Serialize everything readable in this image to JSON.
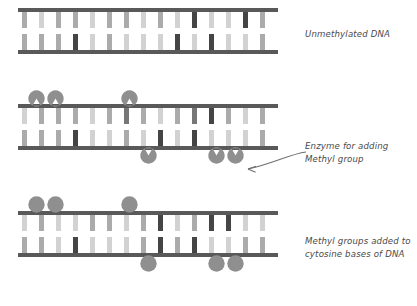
{
  "diagram": {
    "colors": {
      "backbone": "#595959",
      "base_light": "#d2d2d2",
      "base_mid": "#ababab",
      "base_dark": "#454545",
      "base_medium_dark": "#777777",
      "blob_fill": "#8f8f8f",
      "text": "#4a4a4a",
      "background": "#ffffff"
    },
    "labels": {
      "unmethylated": "Unmethylated DNA",
      "enzyme": "Enzyme for adding\nMethyl group",
      "methylated": "Methyl groups added to\ncytosine bases of DNA"
    },
    "panels": [
      {
        "id": "panel-unmethylated",
        "name": "Unmethylated DNA strand",
        "blob_shape": "none",
        "top_rungs": [
          {
            "x": 4,
            "shade": "base_mid"
          },
          {
            "x": 21,
            "shade": "base_light"
          },
          {
            "x": 38,
            "shade": "base_mid"
          },
          {
            "x": 55,
            "shade": "base_mid"
          },
          {
            "x": 72,
            "shade": "base_light"
          },
          {
            "x": 89,
            "shade": "base_mid"
          },
          {
            "x": 106,
            "shade": "base_mid"
          },
          {
            "x": 123,
            "shade": "base_light"
          },
          {
            "x": 140,
            "shade": "base_mid"
          },
          {
            "x": 157,
            "shade": "base_light"
          },
          {
            "x": 174,
            "shade": "base_dark"
          },
          {
            "x": 191,
            "shade": "base_light"
          },
          {
            "x": 208,
            "shade": "base_light"
          },
          {
            "x": 225,
            "shade": "base_dark"
          },
          {
            "x": 242,
            "shade": "base_mid"
          }
        ],
        "bottom_rungs": [
          {
            "x": 4,
            "shade": "base_mid"
          },
          {
            "x": 21,
            "shade": "base_mid"
          },
          {
            "x": 38,
            "shade": "base_mid"
          },
          {
            "x": 55,
            "shade": "base_dark"
          },
          {
            "x": 72,
            "shade": "base_light"
          },
          {
            "x": 89,
            "shade": "base_mid"
          },
          {
            "x": 106,
            "shade": "base_light"
          },
          {
            "x": 123,
            "shade": "base_light"
          },
          {
            "x": 140,
            "shade": "base_light"
          },
          {
            "x": 157,
            "shade": "base_dark"
          },
          {
            "x": 174,
            "shade": "base_light"
          },
          {
            "x": 191,
            "shade": "base_dark"
          },
          {
            "x": 208,
            "shade": "base_light"
          },
          {
            "x": 225,
            "shade": "base_light"
          },
          {
            "x": 242,
            "shade": "base_mid"
          }
        ],
        "top_blobs": [],
        "bottom_blobs": []
      },
      {
        "id": "panel-enzyme",
        "name": "DNA with methyltransferase enzymes approaching",
        "blob_shape": "notched",
        "top_rungs": [
          {
            "x": 4,
            "shade": "base_light"
          },
          {
            "x": 21,
            "shade": "base_mid"
          },
          {
            "x": 38,
            "shade": "base_mid"
          },
          {
            "x": 55,
            "shade": "base_mid"
          },
          {
            "x": 72,
            "shade": "base_light"
          },
          {
            "x": 89,
            "shade": "base_mid"
          },
          {
            "x": 106,
            "shade": "base_medium_dark"
          },
          {
            "x": 123,
            "shade": "base_mid"
          },
          {
            "x": 140,
            "shade": "base_light"
          },
          {
            "x": 157,
            "shade": "base_mid"
          },
          {
            "x": 174,
            "shade": "base_medium_dark"
          },
          {
            "x": 191,
            "shade": "base_dark"
          },
          {
            "x": 208,
            "shade": "base_mid"
          },
          {
            "x": 225,
            "shade": "base_light"
          },
          {
            "x": 242,
            "shade": "base_mid"
          }
        ],
        "bottom_rungs": [
          {
            "x": 4,
            "shade": "base_mid"
          },
          {
            "x": 21,
            "shade": "base_mid"
          },
          {
            "x": 38,
            "shade": "base_mid"
          },
          {
            "x": 55,
            "shade": "base_dark"
          },
          {
            "x": 72,
            "shade": "base_light"
          },
          {
            "x": 89,
            "shade": "base_light"
          },
          {
            "x": 106,
            "shade": "base_mid"
          },
          {
            "x": 123,
            "shade": "base_light"
          },
          {
            "x": 140,
            "shade": "base_dark"
          },
          {
            "x": 157,
            "shade": "base_light"
          },
          {
            "x": 174,
            "shade": "base_dark"
          },
          {
            "x": 191,
            "shade": "base_light"
          },
          {
            "x": 208,
            "shade": "base_light"
          },
          {
            "x": 225,
            "shade": "base_light"
          },
          {
            "x": 242,
            "shade": "base_mid"
          }
        ],
        "top_blobs": [
          10,
          29,
          103
        ],
        "bottom_blobs": [
          122,
          190,
          209
        ]
      },
      {
        "id": "panel-methylated",
        "name": "Methylated DNA strand",
        "blob_shape": "circle",
        "top_rungs": [
          {
            "x": 4,
            "shade": "base_light"
          },
          {
            "x": 21,
            "shade": "base_mid"
          },
          {
            "x": 38,
            "shade": "base_light"
          },
          {
            "x": 55,
            "shade": "base_light"
          },
          {
            "x": 72,
            "shade": "base_mid"
          },
          {
            "x": 89,
            "shade": "base_mid"
          },
          {
            "x": 106,
            "shade": "base_light"
          },
          {
            "x": 123,
            "shade": "base_mid"
          },
          {
            "x": 140,
            "shade": "base_dark"
          },
          {
            "x": 157,
            "shade": "base_light"
          },
          {
            "x": 174,
            "shade": "base_mid"
          },
          {
            "x": 191,
            "shade": "base_dark"
          },
          {
            "x": 208,
            "shade": "base_dark"
          },
          {
            "x": 225,
            "shade": "base_light"
          },
          {
            "x": 242,
            "shade": "base_light"
          }
        ],
        "bottom_rungs": [
          {
            "x": 4,
            "shade": "base_mid"
          },
          {
            "x": 21,
            "shade": "base_mid"
          },
          {
            "x": 38,
            "shade": "base_light"
          },
          {
            "x": 55,
            "shade": "base_dark"
          },
          {
            "x": 72,
            "shade": "base_light"
          },
          {
            "x": 89,
            "shade": "base_light"
          },
          {
            "x": 106,
            "shade": "base_light"
          },
          {
            "x": 123,
            "shade": "base_mid"
          },
          {
            "x": 140,
            "shade": "base_dark"
          },
          {
            "x": 157,
            "shade": "base_mid"
          },
          {
            "x": 174,
            "shade": "base_dark"
          },
          {
            "x": 191,
            "shade": "base_light"
          },
          {
            "x": 208,
            "shade": "base_light"
          },
          {
            "x": 225,
            "shade": "base_mid"
          },
          {
            "x": 242,
            "shade": "base_mid"
          }
        ],
        "top_blobs": [
          10,
          29,
          103
        ],
        "bottom_blobs": [
          122,
          190,
          209
        ]
      }
    ]
  }
}
